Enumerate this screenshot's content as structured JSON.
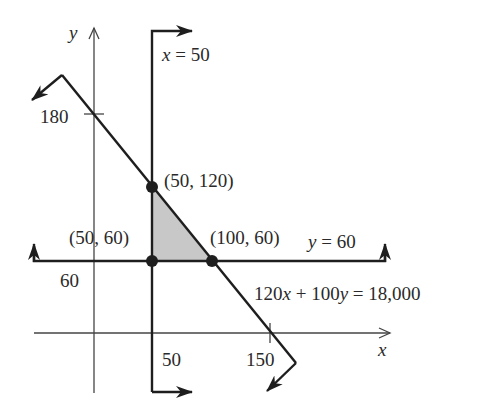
{
  "diagram": {
    "type": "linear-programming-feasible-region",
    "axes": {
      "x_label": "x",
      "y_label": "y",
      "x_ticks": [
        {
          "value": 50,
          "label": "50"
        },
        {
          "value": 150,
          "label": "150"
        }
      ],
      "y_ticks": [
        {
          "value": 60,
          "label": "60"
        },
        {
          "value": 180,
          "label": "180"
        }
      ]
    },
    "lines": {
      "vertical": {
        "label": "x = 50"
      },
      "horizontal": {
        "label": "y = 60"
      },
      "diagonal": {
        "label": "120x + 100y = 18,000"
      }
    },
    "vertices": [
      {
        "x": 50,
        "y": 120,
        "label": "(50, 120)"
      },
      {
        "x": 50,
        "y": 60,
        "label": "(50, 60)"
      },
      {
        "x": 100,
        "y": 60,
        "label": "(100, 60)"
      }
    ],
    "colors": {
      "line": "#1e1e1e",
      "axis": "#444444",
      "region_fill": "#c8c8c8",
      "text": "#2a2a2a"
    }
  }
}
